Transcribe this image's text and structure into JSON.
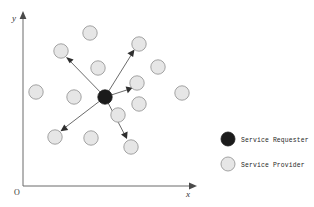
{
  "figure": {
    "background_color": "#ffffff"
  },
  "axes": {
    "x_label": "x",
    "y_label": "y",
    "origin_label": "O",
    "axis_color": "#6b6b6b",
    "x_axis": {
      "x1": 23,
      "y1": 186,
      "x2": 192,
      "y2": 186,
      "arrow_tip_x": 197
    },
    "y_axis": {
      "x1": 23,
      "y1": 186,
      "x2": 23,
      "y2": 16,
      "arrow_tip_y": 11
    }
  },
  "nodes": {
    "requester": {
      "label": "Service Requester",
      "color": "#1b1b1b",
      "radius": 7.2,
      "x": 105,
      "y": 97
    },
    "provider": {
      "label": "Service Provider",
      "fill_color": "#e6e6e6",
      "stroke_color": "#9a9a9a",
      "radius": 7.2,
      "count": 14,
      "positions": [
        {
          "x": 90,
          "y": 33
        },
        {
          "x": 61,
          "y": 51
        },
        {
          "x": 98,
          "y": 68
        },
        {
          "x": 139,
          "y": 44
        },
        {
          "x": 158,
          "y": 67
        },
        {
          "x": 137,
          "y": 83
        },
        {
          "x": 36,
          "y": 92
        },
        {
          "x": 74,
          "y": 97
        },
        {
          "x": 139,
          "y": 104
        },
        {
          "x": 182,
          "y": 93
        },
        {
          "x": 55,
          "y": 137
        },
        {
          "x": 91,
          "y": 138
        },
        {
          "x": 131,
          "y": 147
        },
        {
          "x": 118,
          "y": 115
        }
      ]
    }
  },
  "links": {
    "color": "#5a5a5a",
    "arrow_color": "#2e2e2e",
    "count": 5,
    "edges": [
      {
        "from_x": 105,
        "from_y": 97,
        "to_x": 67,
        "to_y": 58,
        "target": "provider-2"
      },
      {
        "from_x": 105,
        "from_y": 97,
        "to_x": 134,
        "to_y": 50,
        "target": "provider-4"
      },
      {
        "from_x": 105,
        "from_y": 97,
        "to_x": 131,
        "to_y": 88,
        "target": "provider-6"
      },
      {
        "from_x": 105,
        "from_y": 97,
        "to_x": 61,
        "to_y": 131,
        "target": "provider-11"
      },
      {
        "from_x": 105,
        "from_y": 97,
        "to_x": 127,
        "to_y": 139,
        "target": "provider-13"
      }
    ]
  },
  "legend": {
    "items": [
      {
        "label": "Service Requester",
        "swatch_kind": "filled-circle",
        "swatch_color": "#1b1b1b",
        "cx": 228,
        "cy": 139,
        "text_x": 241,
        "text_y": 141.6
      },
      {
        "label": "Service Provider",
        "swatch_kind": "outlined-circle",
        "swatch_color": "#e6e6e6",
        "cx": 228,
        "cy": 164,
        "text_x": 241,
        "text_y": 166.6
      }
    ]
  }
}
